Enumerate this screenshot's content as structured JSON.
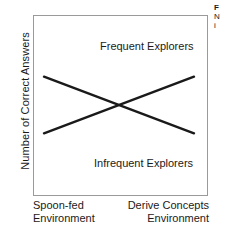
{
  "chart_data": {
    "type": "line",
    "title": "",
    "xlabel": "",
    "ylabel": "Number of Correct Answers",
    "grid": false,
    "legend_position": "inline-annotations",
    "x_ticks": [
      "Spoon-fed Environment",
      "Derive Concepts Environment"
    ],
    "x": [
      0,
      1
    ],
    "xlim": [
      0,
      1
    ],
    "ylim": [
      0,
      1
    ],
    "series": [
      {
        "name": "Frequent Explorers",
        "values": [
          0.23,
          0.78
        ],
        "annotation": "Frequent Explorers"
      },
      {
        "name": "Infrequent Explorers",
        "values": [
          0.78,
          0.23
        ],
        "annotation": "Infrequent Explorers"
      }
    ],
    "crossing_point": {
      "x": 0.5,
      "y": 0.5
    }
  },
  "axes": {
    "y_title": "Number of Correct Answers",
    "x_tick_left_line1": "Spoon-fed",
    "x_tick_left_line2": "Environment",
    "x_tick_right_line1": "Derive Concepts",
    "x_tick_right_line2": "Environment"
  },
  "annotations": {
    "frequent": "Frequent Explorers",
    "infrequent": "Infrequent Explorers"
  },
  "caption": {
    "line1": "F",
    "line2": "N",
    "line3": "i"
  },
  "colors": {
    "line": "#1a1a1a",
    "frame_border": "#9a9a9a",
    "background": "#ffffff",
    "text": "#1a1a1a"
  }
}
